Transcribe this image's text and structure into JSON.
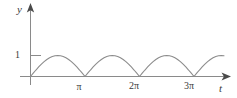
{
  "figure": {
    "name": "rectified-sine-graph",
    "background_color": "#ffffff",
    "curve_color": "#8c8c8c",
    "axis_color": "#8a8a8a",
    "text_color": "#3a3a3a"
  },
  "axes": {
    "y_axis_label": "y",
    "x_axis_label": "t",
    "y_ticks": [
      {
        "label": "1",
        "value": 1
      }
    ],
    "x_ticks": [
      {
        "label": "π",
        "value": 3.14159
      },
      {
        "label": "2π",
        "value": 6.28318
      },
      {
        "label": "3π",
        "value": 9.42478
      }
    ]
  },
  "chart_data": {
    "type": "line",
    "title": "",
    "xlabel": "t",
    "ylabel": "y",
    "xlim": [
      0,
      11.2
    ],
    "ylim": [
      0,
      1.62
    ],
    "grid": false,
    "legend": null,
    "function": "y = |sin(t)|",
    "x_tick_values": [
      3.14159,
      6.28318,
      9.42478
    ],
    "x_tick_labels": [
      "π",
      "2π",
      "3π"
    ],
    "y_tick_values": [
      1
    ],
    "y_tick_labels": [
      "1"
    ],
    "series": [
      {
        "name": "|sin(t)|",
        "x": [
          0.0,
          0.15708,
          0.31416,
          0.47124,
          0.62832,
          0.7854,
          0.94248,
          1.09956,
          1.25664,
          1.41372,
          1.5708,
          1.72788,
          1.88496,
          2.04204,
          2.19911,
          2.35619,
          2.51327,
          2.67035,
          2.82743,
          2.98451,
          3.14159,
          3.29867,
          3.45575,
          3.61283,
          3.76991,
          3.92699,
          4.08407,
          4.24115,
          4.39823,
          4.55531,
          4.71239,
          4.86947,
          5.02655,
          5.18363,
          5.34071,
          5.49779,
          5.65487,
          5.81195,
          5.96903,
          6.12611,
          6.28318,
          6.44026,
          6.59734,
          6.75442,
          6.9115,
          7.06858,
          7.22566,
          7.38274,
          7.53982,
          7.6969,
          7.85398,
          8.01106,
          8.16814,
          8.32522,
          8.4823,
          8.63938,
          8.79646,
          8.95354,
          9.11062,
          9.2677,
          9.42478,
          9.58186,
          9.73894,
          9.89602,
          10.0531,
          10.2102,
          10.3673,
          10.5243,
          10.6814,
          10.8385,
          10.9956,
          11.1527
        ],
        "y": [
          0.0,
          0.15643,
          0.30902,
          0.45399,
          0.58779,
          0.70711,
          0.80902,
          0.89101,
          0.95106,
          0.98769,
          1.0,
          0.98769,
          0.95106,
          0.89101,
          0.80902,
          0.70711,
          0.58779,
          0.45399,
          0.30902,
          0.15643,
          0.0,
          0.15643,
          0.30902,
          0.45399,
          0.58779,
          0.70711,
          0.80902,
          0.89101,
          0.95106,
          0.98769,
          1.0,
          0.98769,
          0.95106,
          0.89101,
          0.80902,
          0.70711,
          0.58779,
          0.45399,
          0.30902,
          0.15643,
          0.0,
          0.15643,
          0.30902,
          0.45399,
          0.58779,
          0.70711,
          0.80902,
          0.89101,
          0.95106,
          0.98769,
          1.0,
          0.98769,
          0.95106,
          0.89101,
          0.80902,
          0.70711,
          0.58779,
          0.45399,
          0.30902,
          0.15643,
          0.0,
          0.15643,
          0.30902,
          0.45399,
          0.58779,
          0.70711,
          0.80902,
          0.89101,
          0.95106,
          0.98769,
          1.0,
          0.98769
        ]
      }
    ]
  }
}
